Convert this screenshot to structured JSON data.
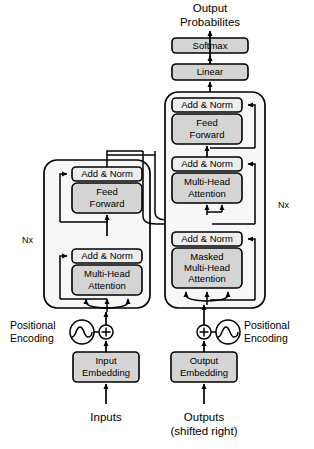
{
  "diagram": {
    "colors": {
      "box_fill_grey": "#d4d4d4",
      "box_fill_light": "#ededed",
      "container_fill": "#f7f7f7",
      "stroke": "#000000",
      "background": "#ffffff"
    }
  },
  "top": {
    "output_line1": "Output",
    "output_line2": "Probabilites",
    "softmax": "Softmax",
    "linear": "Linear"
  },
  "encoder": {
    "repeat_label": "Nx",
    "blocks": [
      {
        "name": "add-norm-top",
        "label": "Add & Norm",
        "style": "light"
      },
      {
        "name": "feed-forward",
        "line1": "Feed",
        "line2": "Forward",
        "style": "grey"
      },
      {
        "name": "add-norm-bottom",
        "label": "Add & Norm",
        "style": "light"
      },
      {
        "name": "multi-head-attention",
        "line1": "Multi-Head",
        "line2": "Attention",
        "style": "grey"
      }
    ]
  },
  "decoder": {
    "repeat_label": "Nx",
    "blocks": [
      {
        "name": "add-norm-top",
        "label": "Add & Norm",
        "style": "light"
      },
      {
        "name": "feed-forward",
        "line1": "Feed",
        "line2": "Forward",
        "style": "grey"
      },
      {
        "name": "add-norm-middle",
        "label": "Add & Norm",
        "style": "light"
      },
      {
        "name": "multi-head-attention",
        "line1": "Multi-Head",
        "line2": "Attention",
        "style": "grey"
      },
      {
        "name": "add-norm-bottom",
        "label": "Add & Norm",
        "style": "light"
      },
      {
        "name": "masked-multi-head-attention",
        "line1": "Masked",
        "line2": "Multi-Head",
        "line3": "Attention",
        "style": "grey"
      }
    ]
  },
  "inputs_side": {
    "positional_line1": "Positional",
    "positional_line2": "Encoding",
    "embedding_line1": "Input",
    "embedding_line2": "Embedding",
    "source_label": "Inputs",
    "operator": "+"
  },
  "outputs_side": {
    "positional_line1": "Positional",
    "positional_line2": "Encoding",
    "embedding_line1": "Output",
    "embedding_line2": "Embedding",
    "source_line1": "Outputs",
    "source_line2": "(shifted right)",
    "operator": "+"
  }
}
